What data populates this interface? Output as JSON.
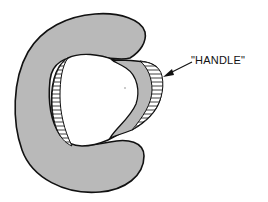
{
  "diagram": {
    "annotations": [
      {
        "text": "\"HANDLE\"",
        "target": "handle-flap"
      }
    ],
    "colors": {
      "body_fill": "#b9b9b9",
      "outline": "#111111",
      "background": "#ffffff",
      "inner": "#ffffff"
    },
    "shapes": [
      "c-shaped-body",
      "inner-opening",
      "hatched-inner-wall",
      "handle-flap",
      "arrow"
    ]
  }
}
